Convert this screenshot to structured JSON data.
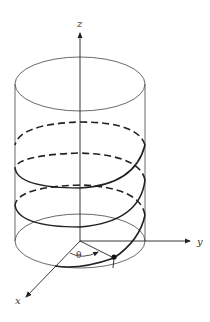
{
  "diagram": {
    "axes": {
      "x_label": "x",
      "y_label": "y",
      "z_label": "z"
    },
    "angle_label": "θ",
    "colors": {
      "stroke": "#222222",
      "thin": "#444444"
    }
  }
}
